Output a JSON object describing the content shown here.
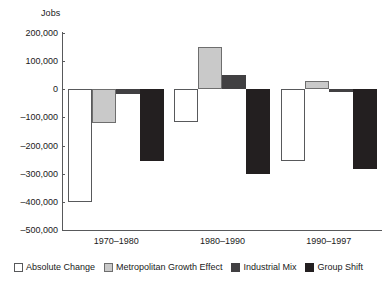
{
  "chart_data": {
    "type": "bar",
    "title": "",
    "subtitle": "",
    "xlabel": "",
    "ylabel": "Jobs",
    "ylim": [
      -500000,
      200000
    ],
    "ytick_values": [
      200000,
      100000,
      0,
      -100000,
      -200000,
      -300000,
      -400000,
      -500000
    ],
    "ytick_labels": [
      "200,000",
      "100,000",
      "0",
      "–100,000",
      "–200,000",
      "–300,000",
      "–400,000",
      "–500,000"
    ],
    "grid": false,
    "legend_position": "bottom",
    "categories": [
      "1970–1980",
      "1980–1990",
      "1990–1997"
    ],
    "series": [
      {
        "name": "Absolute Change",
        "color": "#ffffff",
        "values": [
          -400000,
          -115000,
          -255000
        ]
      },
      {
        "name": "Metropolitan Growth Effect",
        "color": "#c9c9c9",
        "values": [
          -120000,
          150000,
          30000
        ]
      },
      {
        "name": "Industrial Mix",
        "color": "#414042",
        "values": [
          -15000,
          50000,
          -10000
        ]
      },
      {
        "name": "Group Shift",
        "color": "#231f20",
        "values": [
          -255000,
          -300000,
          -285000
        ]
      }
    ]
  },
  "legend": {
    "items": [
      {
        "label": "Absolute Change"
      },
      {
        "label": "Metropolitan Growth Effect"
      },
      {
        "label": "Industrial Mix"
      },
      {
        "label": "Group Shift"
      }
    ]
  }
}
